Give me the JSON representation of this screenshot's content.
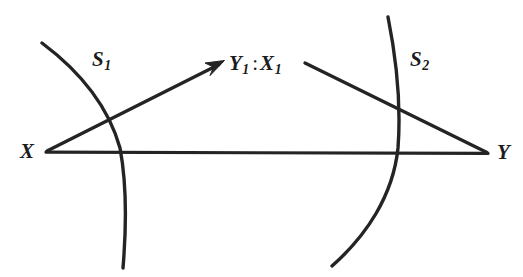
{
  "figure": {
    "type": "geometric-diagram",
    "background_color": "#ffffff",
    "ink_color": "#242424",
    "width": 523,
    "height": 277
  },
  "labels": {
    "vertex_left": "X",
    "vertex_right": "Y",
    "surface_left": "S",
    "surface_left_subscript": "1",
    "surface_right": "S",
    "surface_right_subscript": "2",
    "center_first": "Y",
    "center_first_subscript": "1",
    "center_separator": ":",
    "center_second": "X",
    "center_second_subscript": "1"
  },
  "geometry": {
    "vertex_left_point": [
      46,
      152
    ],
    "vertex_right_point": [
      488,
      153
    ],
    "arrow_tip_point": [
      222,
      62
    ],
    "ray_start_point": [
      305,
      63
    ],
    "arc_left": {
      "start": [
        42,
        43
      ],
      "bulge": [
        122,
        152
      ],
      "end": [
        123,
        268
      ]
    },
    "arc_right": {
      "start": [
        388,
        17
      ],
      "bulge": [
        399,
        146
      ],
      "end": [
        332,
        266
      ]
    }
  }
}
